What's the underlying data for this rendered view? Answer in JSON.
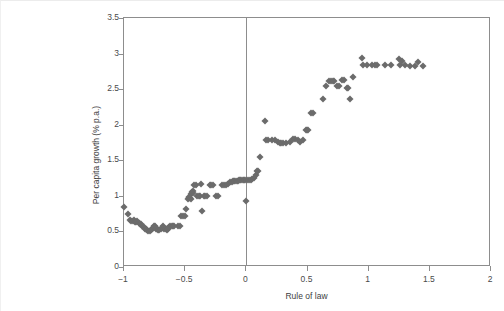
{
  "chart_data": {
    "type": "scatter",
    "title": "",
    "xlabel": "Rule of law",
    "ylabel": "Per capita growth (% p.a.)",
    "xlim": [
      -1,
      2
    ],
    "ylim": [
      0,
      3.5
    ],
    "xticks": [
      -1,
      -0.5,
      0,
      0.5,
      1,
      1.5,
      2
    ],
    "xtick_labels": [
      "−1",
      "−0.5",
      "0",
      "0.5",
      "1",
      "1.5",
      "2"
    ],
    "yticks": [
      0,
      0.5,
      1,
      1.5,
      2,
      2.5,
      3,
      3.5
    ],
    "ytick_labels": [
      "0",
      "0.5",
      "1",
      "1.5",
      "2",
      "2.5",
      "3",
      "3.5"
    ],
    "grid": false,
    "legend": null,
    "marker": "diamond",
    "marker_color": "#6b6b6b",
    "reference_lines": [
      {
        "axis": "x",
        "value": 0,
        "color": "#8d8d8d"
      }
    ],
    "series": [
      {
        "name": "Countries",
        "points": [
          [
            -1.0,
            0.84
          ],
          [
            -0.97,
            0.74
          ],
          [
            -0.95,
            0.66
          ],
          [
            -0.94,
            0.64
          ],
          [
            -0.93,
            0.65
          ],
          [
            -0.92,
            0.66
          ],
          [
            -0.91,
            0.63
          ],
          [
            -0.9,
            0.63
          ],
          [
            -0.89,
            0.65
          ],
          [
            -0.88,
            0.62
          ],
          [
            -0.87,
            0.61
          ],
          [
            -0.86,
            0.6
          ],
          [
            -0.85,
            0.58
          ],
          [
            -0.84,
            0.56
          ],
          [
            -0.83,
            0.54
          ],
          [
            -0.82,
            0.53
          ],
          [
            -0.81,
            0.52
          ],
          [
            -0.8,
            0.51
          ],
          [
            -0.79,
            0.51
          ],
          [
            -0.78,
            0.52
          ],
          [
            -0.77,
            0.53
          ],
          [
            -0.76,
            0.55
          ],
          [
            -0.755,
            0.57
          ],
          [
            -0.75,
            0.58
          ],
          [
            -0.745,
            0.56
          ],
          [
            -0.74,
            0.54
          ],
          [
            -0.73,
            0.53
          ],
          [
            -0.72,
            0.52
          ],
          [
            -0.71,
            0.52
          ],
          [
            -0.7,
            0.53
          ],
          [
            -0.69,
            0.55
          ],
          [
            -0.685,
            0.57
          ],
          [
            -0.68,
            0.56
          ],
          [
            -0.67,
            0.54
          ],
          [
            -0.66,
            0.53
          ],
          [
            -0.65,
            0.52
          ],
          [
            -0.64,
            0.53
          ],
          [
            -0.63,
            0.56
          ],
          [
            -0.62,
            0.57
          ],
          [
            -0.61,
            0.57
          ],
          [
            -0.6,
            0.57
          ],
          [
            -0.59,
            0.57
          ],
          [
            -0.555,
            0.57
          ],
          [
            -0.545,
            0.57
          ],
          [
            -0.53,
            0.71
          ],
          [
            -0.52,
            0.71
          ],
          [
            -0.5,
            0.71
          ],
          [
            -0.49,
            0.81
          ],
          [
            -0.475,
            0.95
          ],
          [
            -0.47,
            0.97
          ],
          [
            -0.465,
            0.99
          ],
          [
            -0.46,
            0.97
          ],
          [
            -0.455,
            0.96
          ],
          [
            -0.45,
            1.02
          ],
          [
            -0.445,
            1.06
          ],
          [
            -0.44,
            1.07
          ],
          [
            -0.435,
            1.04
          ],
          [
            -0.425,
            1.15
          ],
          [
            -0.415,
            1.15
          ],
          [
            -0.4,
            1.0
          ],
          [
            -0.39,
            1.0
          ],
          [
            -0.375,
            1.0
          ],
          [
            -0.37,
            1.16
          ],
          [
            -0.36,
            0.79
          ],
          [
            -0.345,
            1.0
          ],
          [
            -0.335,
            1.0
          ],
          [
            -0.32,
            1.0
          ],
          [
            -0.3,
            1.15
          ],
          [
            -0.285,
            1.15
          ],
          [
            -0.27,
            1.15
          ],
          [
            -0.25,
            1.0
          ],
          [
            -0.235,
            1.0
          ],
          [
            -0.2,
            1.15
          ],
          [
            -0.185,
            1.15
          ],
          [
            -0.165,
            1.15
          ],
          [
            -0.15,
            1.17
          ],
          [
            -0.135,
            1.19
          ],
          [
            -0.12,
            1.2
          ],
          [
            -0.11,
            1.21
          ],
          [
            -0.1,
            1.21
          ],
          [
            -0.09,
            1.21
          ],
          [
            -0.08,
            1.21
          ],
          [
            -0.07,
            1.21
          ],
          [
            -0.06,
            1.22
          ],
          [
            -0.05,
            1.22
          ],
          [
            -0.04,
            1.22
          ],
          [
            -0.03,
            1.22
          ],
          [
            -0.02,
            1.22
          ],
          [
            -0.01,
            1.22
          ],
          [
            0.0,
            0.93
          ],
          [
            0.005,
            1.22
          ],
          [
            0.02,
            1.22
          ],
          [
            0.035,
            1.22
          ],
          [
            0.05,
            1.23
          ],
          [
            0.06,
            1.25
          ],
          [
            0.075,
            1.3
          ],
          [
            0.085,
            1.35
          ],
          [
            0.095,
            1.35
          ],
          [
            0.11,
            1.54
          ],
          [
            0.155,
            2.05
          ],
          [
            0.16,
            1.78
          ],
          [
            0.175,
            1.78
          ],
          [
            0.21,
            1.78
          ],
          [
            0.235,
            1.78
          ],
          [
            0.255,
            1.76
          ],
          [
            0.275,
            1.75
          ],
          [
            0.285,
            1.75
          ],
          [
            0.3,
            1.74
          ],
          [
            0.325,
            1.74
          ],
          [
            0.355,
            1.76
          ],
          [
            0.385,
            1.8
          ],
          [
            0.4,
            1.8
          ],
          [
            0.425,
            1.78
          ],
          [
            0.44,
            1.76
          ],
          [
            0.46,
            1.78
          ],
          [
            0.485,
            1.92
          ],
          [
            0.495,
            1.92
          ],
          [
            0.5,
            1.92
          ],
          [
            0.525,
            2.17
          ],
          [
            0.545,
            2.17
          ],
          [
            0.625,
            2.36
          ],
          [
            0.655,
            2.54
          ],
          [
            0.675,
            2.61
          ],
          [
            0.69,
            2.61
          ],
          [
            0.705,
            2.62
          ],
          [
            0.72,
            2.61
          ],
          [
            0.745,
            2.55
          ],
          [
            0.76,
            2.55
          ],
          [
            0.785,
            2.63
          ],
          [
            0.8,
            2.63
          ],
          [
            0.825,
            2.52
          ],
          [
            0.835,
            2.52
          ],
          [
            0.845,
            2.36
          ],
          [
            0.875,
            2.67
          ],
          [
            0.945,
            2.94
          ],
          [
            0.955,
            2.84
          ],
          [
            0.985,
            2.84
          ],
          [
            1.025,
            2.84
          ],
          [
            1.055,
            2.84
          ],
          [
            1.065,
            2.84
          ],
          [
            1.135,
            2.84
          ],
          [
            1.18,
            2.84
          ],
          [
            1.245,
            2.92
          ],
          [
            1.255,
            2.84
          ],
          [
            1.275,
            2.89
          ],
          [
            1.3,
            2.84
          ],
          [
            1.335,
            2.82
          ],
          [
            1.375,
            2.82
          ],
          [
            1.405,
            2.88
          ],
          [
            1.445,
            2.82
          ]
        ]
      }
    ]
  }
}
